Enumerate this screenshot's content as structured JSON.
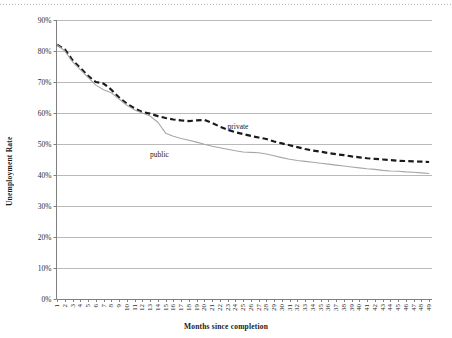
{
  "chart_data": {
    "type": "line",
    "title": "",
    "xlabel": "Months since completion",
    "ylabel": "Unemployment Rate",
    "xlim": [
      1,
      49
    ],
    "ylim": [
      0,
      90
    ],
    "ytick_labels": [
      "0%",
      "10%",
      "20%",
      "30%",
      "40%",
      "50%",
      "60%",
      "70%",
      "80%",
      "90%"
    ],
    "ytick_values": [
      0,
      10,
      20,
      30,
      40,
      50,
      60,
      70,
      80,
      90
    ],
    "grid": "horizontal",
    "legend_position": "inline-annotations",
    "categories": [
      1,
      2,
      3,
      4,
      5,
      6,
      7,
      8,
      9,
      10,
      11,
      12,
      13,
      14,
      15,
      16,
      17,
      18,
      19,
      20,
      21,
      22,
      23,
      24,
      25,
      26,
      27,
      28,
      29,
      30,
      31,
      32,
      33,
      34,
      35,
      36,
      37,
      38,
      39,
      40,
      41,
      42,
      43,
      44,
      45,
      46,
      47,
      48,
      49
    ],
    "series": [
      {
        "name": "private",
        "style": "dashed",
        "color": "#1a1a1a",
        "label_x": 23,
        "label_y": 55.5,
        "values": [
          82.0,
          80.5,
          77.0,
          74.5,
          72.0,
          70.0,
          69.5,
          67.5,
          65.0,
          63.0,
          61.5,
          60.3,
          59.8,
          59.0,
          58.4,
          57.9,
          57.6,
          57.4,
          57.6,
          57.8,
          56.8,
          55.6,
          54.6,
          53.8,
          53.2,
          52.6,
          52.1,
          51.6,
          50.8,
          50.2,
          49.6,
          49.0,
          48.4,
          47.9,
          47.5,
          47.1,
          46.7,
          46.4,
          46.0,
          45.7,
          45.4,
          45.2,
          45.0,
          44.8,
          44.6,
          44.5,
          44.4,
          44.3,
          44.2
        ]
      },
      {
        "name": "public",
        "style": "solid",
        "color": "#a6a6a6",
        "label_x": 13,
        "label_y": 46.5,
        "values": [
          82.0,
          80.0,
          76.5,
          74.0,
          71.5,
          69.0,
          67.5,
          66.5,
          64.5,
          62.5,
          61.0,
          60.0,
          59.0,
          57.0,
          53.5,
          52.5,
          51.8,
          51.2,
          50.6,
          49.9,
          49.3,
          48.8,
          48.3,
          47.8,
          47.4,
          47.3,
          47.2,
          46.8,
          46.2,
          45.6,
          45.1,
          44.7,
          44.4,
          44.1,
          43.8,
          43.5,
          43.2,
          42.9,
          42.6,
          42.3,
          42.0,
          41.8,
          41.5,
          41.3,
          41.2,
          41.0,
          40.9,
          40.7,
          40.5
        ]
      }
    ]
  },
  "axes": {
    "y_title": "Unemployment Rate",
    "x_title": "Months since completion"
  }
}
